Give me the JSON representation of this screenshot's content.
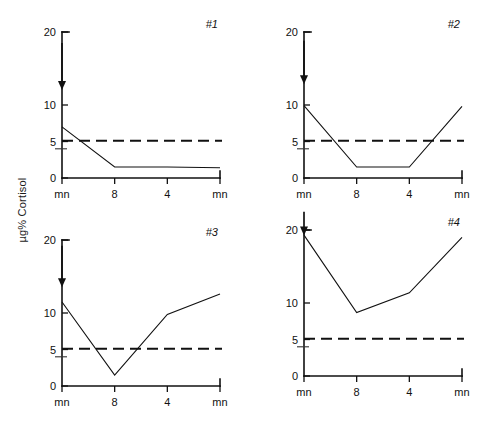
{
  "figure": {
    "y_axis_label": "µg% Cortisol",
    "panels": [
      {
        "tag": "#1",
        "arrow_label": "stimulus-arrow",
        "x_tick_labels": [
          "mn",
          "8",
          "4",
          "mn"
        ],
        "y_tick_labels": [
          "0",
          "5",
          "10",
          "20"
        ]
      },
      {
        "tag": "#2",
        "arrow_label": "stimulus-arrow",
        "x_tick_labels": [
          "mn",
          "8",
          "4",
          "mn"
        ],
        "y_tick_labels": [
          "0",
          "5",
          "10",
          "20"
        ]
      },
      {
        "tag": "#3",
        "arrow_label": "stimulus-arrow",
        "x_tick_labels": [
          "mn",
          "8",
          "4",
          "mn"
        ],
        "y_tick_labels": [
          "0",
          "5",
          "10",
          "20"
        ]
      },
      {
        "tag": "#4",
        "arrow_label": "stimulus-arrow",
        "x_tick_labels": [
          "mn",
          "8",
          "4",
          "mn"
        ],
        "y_tick_labels": [
          "0",
          "5",
          "10",
          "20"
        ]
      }
    ]
  },
  "chart_data": [
    {
      "type": "line",
      "title": "#1",
      "xlabel": "",
      "ylabel": "µg% Cortisol",
      "x": [
        "mn",
        "8",
        "4",
        "mn"
      ],
      "categories": [
        "mn",
        "8",
        "4",
        "mn"
      ],
      "values": [
        7.0,
        1.5,
        1.5,
        1.4
      ],
      "ylim": [
        0,
        20
      ],
      "yticks": [
        0,
        5,
        10,
        20
      ],
      "yticks_minor": [
        4
      ],
      "grid": false,
      "legend": "none",
      "annotations": [
        {
          "type": "reference-line",
          "orientation": "horizontal",
          "value": 5.1,
          "style": "dashed"
        },
        {
          "type": "arrow",
          "direction": "down",
          "x_category": "mn",
          "y_from": 18.5,
          "y_to": 13.0
        }
      ]
    },
    {
      "type": "line",
      "title": "#2",
      "xlabel": "",
      "ylabel": "µg% Cortisol",
      "x": [
        "mn",
        "8",
        "4",
        "mn"
      ],
      "categories": [
        "mn",
        "8",
        "4",
        "mn"
      ],
      "values": [
        9.9,
        1.5,
        1.5,
        9.8
      ],
      "ylim": [
        0,
        20
      ],
      "yticks": [
        0,
        5,
        10,
        20
      ],
      "yticks_minor": [
        4
      ],
      "grid": false,
      "legend": "none",
      "annotations": [
        {
          "type": "reference-line",
          "orientation": "horizontal",
          "value": 5.1,
          "style": "dashed"
        },
        {
          "type": "arrow",
          "direction": "down",
          "x_category": "mn",
          "y_from": 18.8,
          "y_to": 13.8
        }
      ]
    },
    {
      "type": "line",
      "title": "#3",
      "xlabel": "",
      "ylabel": "µg% Cortisol",
      "x": [
        "mn",
        "8",
        "4",
        "mn"
      ],
      "categories": [
        "mn",
        "8",
        "4",
        "mn"
      ],
      "values": [
        11.5,
        1.5,
        9.8,
        12.6
      ],
      "ylim": [
        0,
        20
      ],
      "yticks": [
        0,
        5,
        10,
        20
      ],
      "yticks_minor": [
        4
      ],
      "grid": false,
      "legend": "none",
      "annotations": [
        {
          "type": "reference-line",
          "orientation": "horizontal",
          "value": 5.1,
          "style": "dashed"
        },
        {
          "type": "arrow",
          "direction": "down",
          "x_category": "mn",
          "y_from": 19.2,
          "y_to": 14.5
        }
      ]
    },
    {
      "type": "line",
      "title": "#4",
      "xlabel": "",
      "ylabel": "µg% Cortisol",
      "x": [
        "mn",
        "8",
        "4",
        "mn"
      ],
      "categories": [
        "mn",
        "8",
        "4",
        "mn"
      ],
      "values": [
        19.3,
        8.7,
        11.4,
        19.0
      ],
      "ylim": [
        0,
        20
      ],
      "yticks": [
        0,
        5,
        10,
        20
      ],
      "yticks_minor": [
        4
      ],
      "grid": false,
      "legend": "none",
      "annotations": [
        {
          "type": "reference-line",
          "orientation": "horizontal",
          "value": 5.1,
          "style": "dashed"
        },
        {
          "type": "arrow",
          "direction": "down",
          "x_category": "mn",
          "y_from": 22.5,
          "y_to": 20.2
        }
      ]
    }
  ]
}
